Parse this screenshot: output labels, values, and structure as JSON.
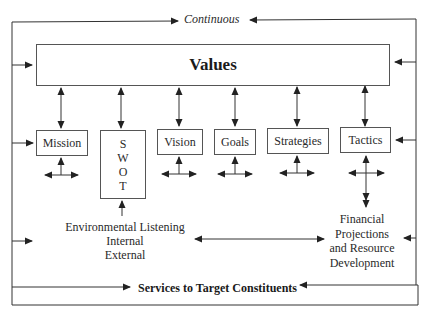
{
  "diagram": {
    "top_label": "Continuous",
    "values_label": "Values",
    "components": [
      {
        "id": "mission",
        "label": "Mission"
      },
      {
        "id": "swot",
        "label": "SWOT",
        "letters": [
          "S",
          "W",
          "O",
          "T"
        ]
      },
      {
        "id": "vision",
        "label": "Vision"
      },
      {
        "id": "goals",
        "label": "Goals"
      },
      {
        "id": "strategies",
        "label": "Strategies"
      },
      {
        "id": "tactics",
        "label": "Tactics"
      }
    ],
    "environmental": {
      "line1": "Environmental Listening",
      "line2": "Internal",
      "line3": "External"
    },
    "financial": {
      "line1": "Financial",
      "line2": "Projections",
      "line3": "and Resource",
      "line4": "Development"
    },
    "bottom_label": "Services to Target Constituents",
    "colors": {
      "line": "#333333",
      "text": "#2a2a2a",
      "background": "#ffffff"
    }
  }
}
